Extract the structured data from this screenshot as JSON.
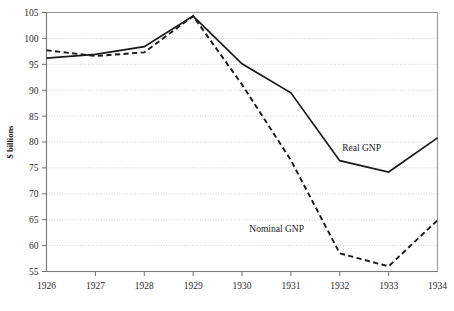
{
  "chart_data": {
    "type": "line",
    "title": "",
    "xlabel": "",
    "ylabel": "$ billions",
    "x": [
      1926,
      1927,
      1928,
      1929,
      1930,
      1931,
      1932,
      1933,
      1934
    ],
    "categories": [
      "1926",
      "1927",
      "1928",
      "1929",
      "1930",
      "1931",
      "1932",
      "1933",
      "1934"
    ],
    "xlim": [
      1926,
      1934
    ],
    "ylim": [
      55,
      105
    ],
    "ytick_labels": [
      "55",
      "60",
      "65",
      "70",
      "75",
      "80",
      "85",
      "90",
      "95",
      "100",
      "105"
    ],
    "ytick_values": [
      55,
      60,
      65,
      70,
      75,
      80,
      85,
      90,
      95,
      100,
      105
    ],
    "ytick_step": 5,
    "grid": true,
    "grid_axis": "y",
    "grid_style": "dotted",
    "legend": "inline-annotations",
    "legend_position": "inside-plot",
    "series": [
      {
        "name": "Real GNP",
        "style": "solid",
        "color": "#1a1a1a",
        "values": [
          96.2,
          96.9,
          98.4,
          104.3,
          95.1,
          89.5,
          76.4,
          74.2,
          80.8
        ],
        "label_text": "Real GNP",
        "label_x": 1932.05,
        "label_y": 78.2
      },
      {
        "name": "Nominal GNP",
        "style": "dashed",
        "color": "#1a1a1a",
        "values": [
          97.7,
          96.6,
          97.3,
          104.3,
          91.1,
          76.5,
          58.5,
          56.0,
          64.9
        ],
        "label_text": "Nominal GNP",
        "label_x": 1930.15,
        "label_y": 62.6
      }
    ]
  }
}
